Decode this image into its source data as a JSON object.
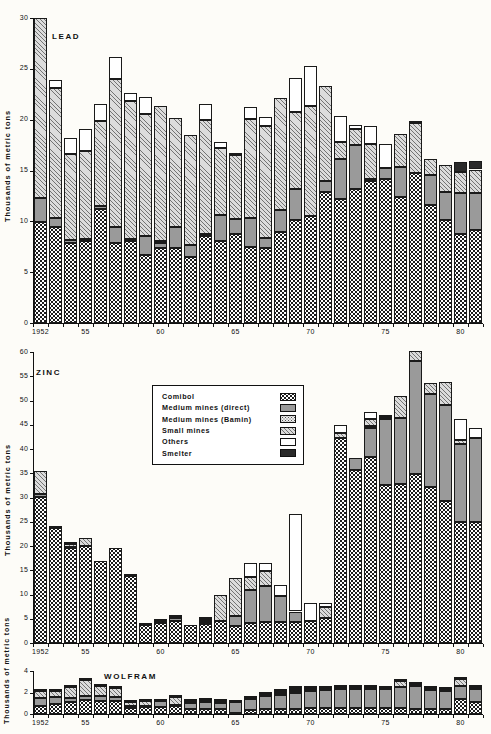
{
  "figure": {
    "axis_label": "Thousands of metric tons",
    "x_tick_labels": [
      "1952",
      "55",
      "60",
      "65",
      "70",
      "75",
      "80"
    ],
    "x_tick_years": [
      1952,
      1955,
      1960,
      1965,
      1970,
      1975,
      1980
    ]
  },
  "legend": {
    "items": [
      {
        "label": "Comibol",
        "swatch": "comibol-swatch",
        "fill": "f-comibol",
        "color": "#ffffff"
      },
      {
        "label": "Medium  mines (direct)",
        "swatch": "medium-direct-swatch",
        "fill": "f-medium-direct",
        "color": "#9a9a9a"
      },
      {
        "label": "Medium  mines (Bamin)",
        "swatch": "medium-bamin-swatch",
        "fill": "f-medium-bamin",
        "color": "#efefef"
      },
      {
        "label": "Small  mines",
        "swatch": "small-mines-swatch",
        "fill": "f-small",
        "color": "#dcdcdc"
      },
      {
        "label": "Others",
        "swatch": "others-swatch",
        "fill": "f-others",
        "color": "#ffffff"
      },
      {
        "label": "Smelter",
        "swatch": "smelter-swatch",
        "fill": "f-smelter",
        "color": "#2a2a2a"
      }
    ]
  },
  "chart_data": [
    {
      "type": "bar",
      "stacked": true,
      "title": "LEAD",
      "xlabel": "",
      "ylabel": "Thousands of metric tons",
      "ylim": [
        0,
        30
      ],
      "yticks": [
        0,
        5,
        10,
        15,
        20,
        25,
        30
      ],
      "grid": false,
      "legend_position": "none",
      "categories": [
        1952,
        1953,
        1954,
        1955,
        1956,
        1957,
        1958,
        1959,
        1960,
        1961,
        1962,
        1963,
        1964,
        1965,
        1966,
        1967,
        1968,
        1969,
        1970,
        1971,
        1972,
        1973,
        1974,
        1975,
        1976,
        1977,
        1978,
        1979,
        1980,
        1981
      ],
      "series": [
        {
          "name": "Comibol",
          "values": [
            9.9,
            9.4,
            7.9,
            8.1,
            11.2,
            7.9,
            8.1,
            6.7,
            7.4,
            7.4,
            6.5,
            8.6,
            8.1,
            8.8,
            7.5,
            7.4,
            9.0,
            10.1,
            10.5,
            12.9,
            12.2,
            13.2,
            14.0,
            14.2,
            12.4,
            14.8,
            11.6,
            10.1,
            8.8,
            9.1
          ]
        },
        {
          "name": "Medium mines (direct)",
          "values": [
            2.4,
            0.9,
            0.3,
            0.2,
            0.3,
            1.5,
            0.2,
            1.9,
            0.5,
            2.0,
            1.2,
            0.2,
            2.5,
            1.4,
            2.8,
            1.0,
            2.1,
            3.1,
            0.0,
            1.1,
            3.9,
            4.3,
            0.2,
            1.0,
            2.9,
            0.0,
            3.0,
            2.8,
            4.0,
            3.7
          ]
        },
        {
          "name": "Medium mines (Bamin)",
          "values": [
            0,
            0,
            0,
            0,
            0,
            0,
            0,
            0,
            0.2,
            0,
            0,
            0,
            0,
            0,
            0,
            0,
            0,
            0,
            0,
            0,
            0,
            0,
            0,
            0,
            0,
            0,
            0,
            0,
            0,
            0
          ]
        },
        {
          "name": "Small mines",
          "values": [
            17.7,
            12.8,
            8.4,
            8.6,
            8.4,
            14.6,
            13.5,
            12.0,
            13.2,
            10.8,
            10.8,
            11.2,
            6.6,
            6.3,
            9.8,
            11.0,
            11.0,
            7.6,
            10.8,
            9.3,
            1.7,
            1.6,
            3.4,
            0.0,
            3.3,
            4.9,
            1.5,
            2.6,
            2.1,
            2.3
          ]
        },
        {
          "name": "Others",
          "values": [
            0,
            0.8,
            1.6,
            2.2,
            1.6,
            2.2,
            0.8,
            1.6,
            0.0,
            0.0,
            0.0,
            1.5,
            0.6,
            0.1,
            1.1,
            0.9,
            0.0,
            3.3,
            4.0,
            0.0,
            2.6,
            0.4,
            1.8,
            2.4,
            0.0,
            0.0,
            0.0,
            0.0,
            0.0,
            0.0
          ]
        },
        {
          "name": "Smelter",
          "values": [
            0,
            0,
            0,
            0,
            0,
            0,
            0,
            0,
            0,
            0,
            0,
            0,
            0,
            0,
            0,
            0,
            0,
            0,
            0,
            0,
            0,
            0,
            0,
            0,
            0,
            0.2,
            0,
            0,
            0.9,
            0.8
          ]
        }
      ],
      "totals": [
        30.0,
        23.9,
        18.2,
        19.1,
        21.5,
        26.2,
        22.6,
        22.2,
        21.3,
        20.2,
        18.5,
        21.5,
        17.8,
        16.6,
        21.2,
        20.3,
        22.1,
        24.1,
        25.3,
        23.3,
        20.4,
        19.5,
        19.4,
        17.6,
        18.6,
        19.9,
        16.1,
        15.5,
        15.8,
        15.9
      ]
    },
    {
      "type": "bar",
      "stacked": true,
      "title": "ZINC",
      "xlabel": "",
      "ylabel": "Thousands of metric tons",
      "ylim": [
        0,
        60
      ],
      "yticks": [
        0,
        5,
        10,
        15,
        20,
        25,
        30,
        35,
        40,
        45,
        50,
        55,
        60
      ],
      "grid": false,
      "legend_position": "upper-center",
      "categories": [
        1952,
        1953,
        1954,
        1955,
        1956,
        1957,
        1958,
        1959,
        1960,
        1961,
        1962,
        1963,
        1964,
        1965,
        1966,
        1967,
        1968,
        1969,
        1970,
        1971,
        1972,
        1973,
        1974,
        1975,
        1976,
        1977,
        1978,
        1979,
        1980,
        1981
      ],
      "series": [
        {
          "name": "Comibol",
          "values": [
            30.1,
            23.8,
            19.5,
            20.0,
            16.9,
            19.6,
            13.9,
            3.8,
            4.2,
            4.6,
            3.8,
            4.0,
            4.5,
            3.5,
            4.1,
            4.4,
            4.3,
            4.4,
            4.6,
            5.1,
            42.3,
            35.6,
            38.4,
            32.6,
            32.8,
            34.9,
            32.2,
            29.2,
            25.0,
            25.0
          ]
        },
        {
          "name": "Medium mines (direct)",
          "values": [
            0.6,
            0,
            0.4,
            0,
            0,
            0,
            0,
            0,
            0.3,
            0.5,
            0,
            0.3,
            0,
            2.1,
            6.8,
            7.3,
            5.4,
            2.1,
            0,
            0,
            0,
            2.5,
            6.0,
            13.6,
            13.5,
            23.3,
            19.1,
            19.8,
            16.0,
            17.2
          ]
        },
        {
          "name": "Medium mines (Bamin)",
          "values": [
            0,
            0,
            0,
            0,
            0,
            0,
            0,
            0,
            0,
            0.3,
            0,
            0.4,
            0,
            0,
            0,
            0,
            0,
            0,
            0,
            0,
            0,
            0,
            0.3,
            0.3,
            0,
            0,
            0,
            0,
            0,
            0
          ]
        },
        {
          "name": "Small mines",
          "values": [
            4.7,
            0.2,
            0.5,
            1.6,
            0,
            0,
            0.2,
            0.1,
            0.1,
            0.1,
            0,
            0.3,
            5.3,
            7.8,
            2.8,
            3.1,
            0,
            0,
            0,
            2.3,
            1.1,
            0,
            1.4,
            0,
            4.7,
            2.1,
            2.3,
            4.9,
            0.9,
            0
          ]
        },
        {
          "name": "Others",
          "values": [
            0,
            0,
            0,
            0,
            0,
            0,
            0,
            0,
            0,
            0,
            0,
            0,
            0,
            0,
            2.8,
            1.6,
            2.2,
            20.0,
            3.6,
            0.8,
            1.6,
            0,
            1.6,
            0.4,
            0,
            0,
            0,
            0,
            4.2,
            2.1
          ]
        },
        {
          "name": "Smelter",
          "values": [
            0,
            0,
            0.1,
            0,
            0,
            0,
            0,
            0,
            0,
            0,
            0,
            0.3,
            0,
            0,
            0,
            0,
            0,
            0,
            0,
            0,
            0,
            0,
            0,
            0,
            0,
            0,
            0,
            0,
            0,
            0
          ]
        }
      ],
      "totals": [
        35.4,
        24.0,
        20.5,
        21.6,
        16.9,
        19.6,
        14.1,
        3.9,
        4.6,
        5.5,
        3.8,
        5.3,
        9.8,
        13.4,
        16.5,
        16.4,
        11.9,
        26.5,
        8.2,
        8.2,
        45.0,
        38.1,
        47.7,
        46.9,
        51.0,
        60.3,
        53.6,
        53.9,
        46.1,
        44.3
      ]
    },
    {
      "type": "bar",
      "stacked": true,
      "title": "WOLFRAM",
      "xlabel": "",
      "ylabel": "Thousands of metric tons",
      "ylim": [
        0,
        4
      ],
      "yticks": [
        0,
        2,
        4
      ],
      "grid": false,
      "legend_position": "none",
      "categories": [
        1952,
        1953,
        1954,
        1955,
        1956,
        1957,
        1958,
        1959,
        1960,
        1961,
        1962,
        1963,
        1964,
        1965,
        1966,
        1967,
        1968,
        1969,
        1970,
        1971,
        1972,
        1973,
        1974,
        1975,
        1976,
        1977,
        1978,
        1979,
        1980,
        1981
      ],
      "series": [
        {
          "name": "Comibol",
          "values": [
            0.75,
            0.95,
            1.15,
            1.3,
            1.25,
            1.25,
            0.55,
            0.65,
            0.65,
            0.7,
            0.5,
            0.5,
            0.45,
            0.05,
            0.35,
            0.45,
            0.45,
            0.5,
            0.55,
            0.6,
            0.6,
            0.6,
            0.6,
            0.6,
            0.55,
            0.5,
            0.5,
            0.5,
            1.4,
            1.15
          ]
        },
        {
          "name": "Medium mines (direct)",
          "values": [
            0.75,
            0.6,
            0.35,
            0.35,
            0.4,
            0.3,
            0.15,
            0.1,
            0.55,
            0.15,
            0.55,
            0.65,
            0.6,
            1.05,
            1.05,
            1.25,
            1.35,
            1.5,
            1.55,
            1.65,
            1.75,
            1.75,
            1.7,
            1.7,
            2.0,
            2.1,
            1.7,
            1.65,
            1.2,
            1.2
          ]
        },
        {
          "name": "Medium mines (Bamin)",
          "values": [
            0,
            0,
            0,
            0,
            0,
            0,
            0,
            0,
            0,
            0,
            0,
            0,
            0,
            0,
            0,
            0,
            0,
            0.15,
            0.15,
            0,
            0,
            0,
            0,
            0,
            0,
            0,
            0,
            0,
            0,
            0
          ]
        },
        {
          "name": "Small mines",
          "values": [
            0.65,
            0.55,
            1.05,
            1.55,
            0.95,
            0.85,
            0.4,
            0.45,
            0.05,
            0.75,
            0.2,
            0.2,
            0.2,
            0.05,
            0.1,
            0.15,
            0.2,
            0.1,
            0.2,
            0.2,
            0.2,
            0.2,
            0.2,
            0.15,
            0.55,
            0.2,
            0.25,
            0.2,
            0.7,
            0.2
          ]
        },
        {
          "name": "Others",
          "values": [
            0,
            0,
            0,
            0,
            0,
            0,
            0,
            0,
            0,
            0,
            0,
            0,
            0,
            0,
            0,
            0,
            0.15,
            0.15,
            0,
            0,
            0,
            0,
            0,
            0,
            0,
            0,
            0,
            0,
            0,
            0
          ]
        },
        {
          "name": "Smelter",
          "values": [
            0.05,
            0.05,
            0.05,
            0.05,
            0.05,
            0.05,
            0.05,
            0.05,
            0.05,
            0.05,
            0.05,
            0.05,
            0.05,
            0.05,
            0.05,
            0.05,
            0.05,
            0.05,
            0.05,
            0.05,
            0.05,
            0.05,
            0.05,
            0.05,
            0.05,
            0.05,
            0.05,
            0.05,
            0.05,
            0.05
          ]
        }
      ],
      "totals": [
        2.2,
        2.15,
        2.6,
        3.25,
        2.65,
        2.45,
        1.15,
        1.25,
        1.3,
        1.65,
        1.3,
        1.4,
        1.3,
        1.2,
        1.55,
        1.9,
        2.2,
        2.45,
        2.5,
        2.5,
        2.6,
        2.6,
        2.55,
        2.5,
        3.15,
        2.85,
        2.5,
        2.4,
        3.35,
        2.6
      ]
    }
  ]
}
